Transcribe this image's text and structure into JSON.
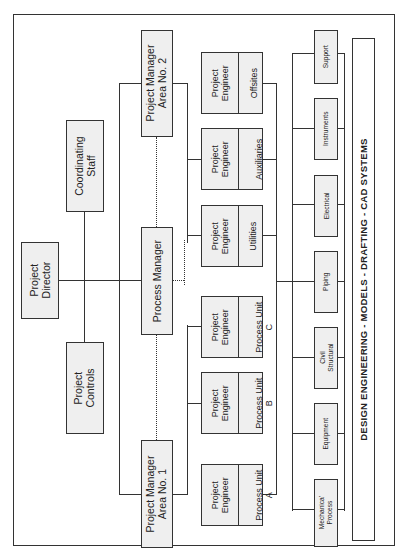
{
  "diagram": {
    "orientation": "rotated 90 degrees counter-clockwise",
    "top": {
      "director": "Project\nDirector",
      "controls": "Project\nControls",
      "coordinating": "Coordinating\nStaff"
    },
    "managers": {
      "area1": "Project Manager\nArea No. 1",
      "process": "Process Manager",
      "area2": "Project Manager\nArea No. 2"
    },
    "engineers": [
      {
        "role": "Project\nEngineer",
        "unit": "Process Unit\nA"
      },
      {
        "role": "Project\nEngineer",
        "unit": "Process Unit\nB"
      },
      {
        "role": "Project\nEngineer",
        "unit": "Process Unit\nC"
      },
      {
        "role": "Project\nEngineer",
        "unit": "Utilities"
      },
      {
        "role": "Project\nEngineer",
        "unit": "Auxiliaries"
      },
      {
        "role": "Project\nEngineer",
        "unit": "Offsites"
      }
    ],
    "disciplines": [
      "Mechanica'\nProcess",
      "Equipment",
      "Civil\nStructural",
      "Piping",
      "Electrical",
      "Instruments",
      "Support"
    ],
    "footer_bar": "DESIGN ENGINEERING - MODELS - DRAFTING - CAD SYSTEMS"
  }
}
